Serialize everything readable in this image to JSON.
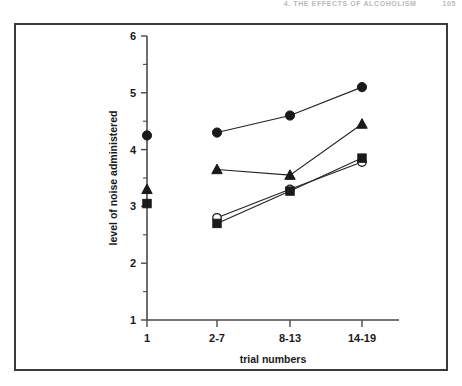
{
  "running_head": {
    "text": "4. THE EFFECTS OF ALCOHOLISM",
    "page_number": "105"
  },
  "chart_data": {
    "type": "line",
    "title": "",
    "xlabel": "trial numbers",
    "ylabel": "level of noise administered",
    "categories": [
      "1",
      "2-7",
      "8-13",
      "14-19"
    ],
    "ylim": [
      1,
      6
    ],
    "yticks": [
      1,
      2,
      3,
      4,
      5,
      6
    ],
    "ytick_labels": [
      "1",
      "2",
      "3",
      "4",
      "5",
      "6"
    ],
    "y_minor_ticks": [
      1.5,
      2.5,
      3.5,
      4.5,
      5.5
    ],
    "grid": false,
    "legend_position": "none",
    "note": "Trial 1 points are plotted as isolated markers with no connecting line; the remaining three trial blocks are joined by lines.",
    "series": [
      {
        "name": "filled-circle",
        "marker": "filled-circle",
        "color": "#1a1a1a",
        "values": [
          4.25,
          4.3,
          4.6,
          5.1
        ],
        "connected_from_index": 1
      },
      {
        "name": "filled-triangle",
        "marker": "filled-triangle",
        "color": "#1a1a1a",
        "values": [
          3.3,
          3.65,
          3.55,
          4.45
        ],
        "connected_from_index": 1
      },
      {
        "name": "filled-square",
        "marker": "filled-square",
        "color": "#1a1a1a",
        "values": [
          3.05,
          2.7,
          3.27,
          3.85
        ],
        "connected_from_index": 1
      },
      {
        "name": "open-circle",
        "marker": "open-circle",
        "color": "#1a1a1a",
        "values": [
          null,
          2.8,
          3.3,
          3.78
        ],
        "connected_from_index": 1
      }
    ]
  }
}
